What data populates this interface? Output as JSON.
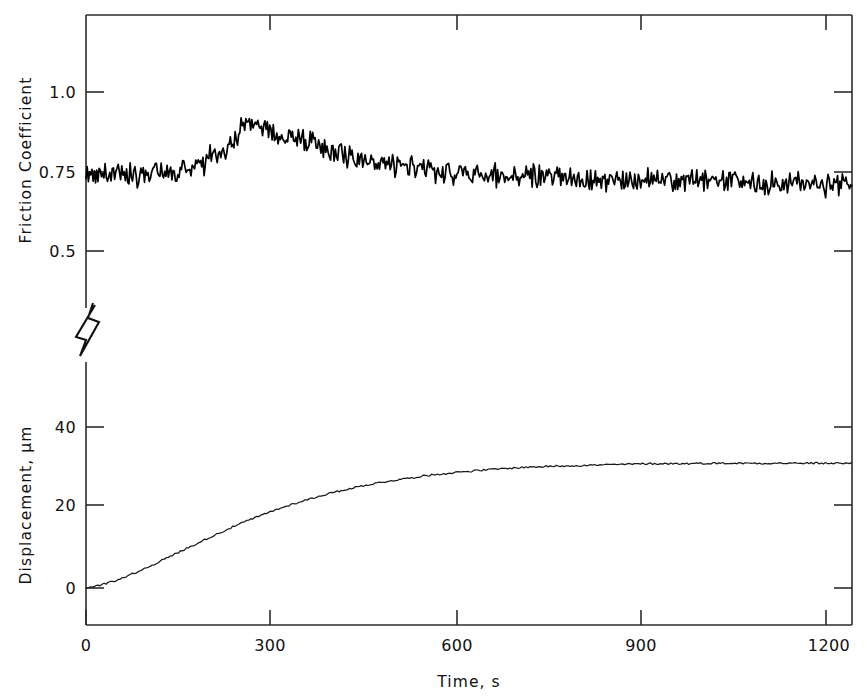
{
  "chart_data": {
    "type": "line",
    "title": "",
    "subtitle": "",
    "xlabel": "Time, s",
    "x_ticks": [
      0,
      300,
      600,
      900,
      1200
    ],
    "x_tick_labels": [
      "0",
      "300",
      "600",
      "900",
      "1200"
    ],
    "xlim": [
      0,
      1220
    ],
    "grid": false,
    "legend": "none",
    "panels": [
      {
        "name": "friction-panel",
        "ylabel": "Friction Coefficient",
        "y_ticks": [
          0.5,
          0.75,
          1.0
        ],
        "y_tick_labels": [
          "0.5",
          "0.75",
          "1.0"
        ],
        "ylim": [
          0.42,
          1.12
        ],
        "series": [
          {
            "name": "friction-coefficient",
            "x": [
              0,
              10,
              20,
              30,
              40,
              50,
              60,
              70,
              80,
              90,
              100,
              110,
              120,
              130,
              140,
              150,
              160,
              170,
              180,
              190,
              200,
              210,
              220,
              230,
              240,
              250,
              260,
              270,
              280,
              290,
              300,
              320,
              340,
              360,
              380,
              400,
              420,
              440,
              460,
              480,
              500,
              520,
              540,
              560,
              580,
              600,
              620,
              640,
              660,
              680,
              700,
              720,
              740,
              760,
              780,
              800,
              820,
              840,
              860,
              880,
              900,
              920,
              940,
              960,
              980,
              1000,
              1020,
              1040,
              1060,
              1080,
              1100,
              1120,
              1140,
              1160,
              1180,
              1200,
              1220
            ],
            "values": [
              0.745,
              0.742,
              0.74,
              0.744,
              0.738,
              0.742,
              0.736,
              0.745,
              0.74,
              0.747,
              0.742,
              0.75,
              0.745,
              0.758,
              0.748,
              0.765,
              0.757,
              0.772,
              0.766,
              0.782,
              0.79,
              0.8,
              0.815,
              0.84,
              0.865,
              0.885,
              0.895,
              0.89,
              0.885,
              0.878,
              0.872,
              0.862,
              0.852,
              0.84,
              0.828,
              0.815,
              0.8,
              0.788,
              0.778,
              0.77,
              0.762,
              0.757,
              0.752,
              0.748,
              0.745,
              0.742,
              0.74,
              0.738,
              0.737,
              0.735,
              0.734,
              0.733,
              0.732,
              0.731,
              0.73,
              0.729,
              0.728,
              0.727,
              0.726,
              0.725,
              0.724,
              0.723,
              0.722,
              0.721,
              0.72,
              0.719,
              0.718,
              0.717,
              0.716,
              0.715,
              0.714,
              0.713,
              0.712,
              0.711,
              0.71,
              0.709,
              0.708
            ],
            "noise_amplitude": 0.028
          }
        ]
      },
      {
        "name": "displacement-panel",
        "ylabel": "Displacement, µm",
        "y_ticks": [
          0,
          20,
          40
        ],
        "y_tick_labels": [
          "0",
          "20",
          "40"
        ],
        "ylim": [
          -6,
          52
        ],
        "series": [
          {
            "name": "displacement",
            "x": [
              0,
              20,
              40,
              60,
              80,
              100,
              120,
              140,
              160,
              180,
              200,
              220,
              240,
              260,
              280,
              300,
              330,
              360,
              390,
              420,
              450,
              480,
              510,
              540,
              570,
              600,
              650,
              700,
              750,
              800,
              850,
              900,
              950,
              1000,
              1050,
              1100,
              1150,
              1220
            ],
            "values": [
              0.0,
              0.6,
              1.5,
              2.6,
              3.9,
              5.3,
              6.8,
              8.3,
              9.8,
              11.3,
              12.8,
              14.2,
              15.6,
              16.9,
              18.1,
              19.3,
              20.9,
              22.3,
              23.6,
              24.7,
              25.7,
              26.5,
              27.2,
              27.9,
              28.4,
              28.9,
              29.5,
              30.0,
              30.3,
              30.5,
              30.7,
              30.9,
              30.9,
              31.0,
              31.0,
              31.0,
              31.0,
              31.0
            ],
            "noise_amplitude": 0.22
          }
        ]
      }
    ],
    "axis_break": {
      "present": true,
      "symbol": "zigzag",
      "axis": "y-left"
    }
  }
}
